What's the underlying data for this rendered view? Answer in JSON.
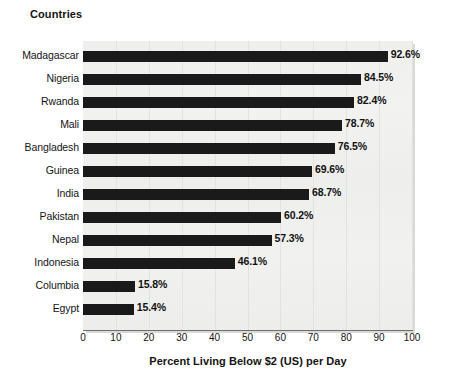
{
  "chart_data": {
    "type": "bar",
    "orientation": "horizontal",
    "title": "Countries",
    "xlabel": "Percent Living Below $2 (US) per Day",
    "ylabel": "Countries",
    "xlim": [
      0,
      100
    ],
    "xticks": [
      0,
      10,
      20,
      30,
      40,
      50,
      60,
      70,
      80,
      90,
      100
    ],
    "xtick_labels": [
      "0",
      "10",
      "20",
      "30",
      "40",
      "50",
      "60",
      "70",
      "80",
      "90",
      "100"
    ],
    "grid": "vertical",
    "legend": null,
    "categories": [
      "Madagascar",
      "Nigeria",
      "Rwanda",
      "Mali",
      "Bangladesh",
      "Guinea",
      "India",
      "Pakistan",
      "Nepal",
      "Indonesia",
      "Columbia",
      "Egypt"
    ],
    "values": [
      92.6,
      84.5,
      82.4,
      78.7,
      76.5,
      69.6,
      68.7,
      60.2,
      57.3,
      46.1,
      15.8,
      15.4
    ],
    "data_labels": [
      "92.6%",
      "84.5%",
      "82.4%",
      "78.7%",
      "76.5%",
      "69.6%",
      "68.7%",
      "60.2%",
      "57.3%",
      "46.1%",
      "15.8%",
      "15.4%"
    ],
    "colors": {
      "bar": "#1a1a1a",
      "plot_background": "#f0f0ef",
      "gridline": "#e2e2e0",
      "axis": "#6e6e6e",
      "text": "#141414",
      "page_background": "#ffffff"
    }
  }
}
